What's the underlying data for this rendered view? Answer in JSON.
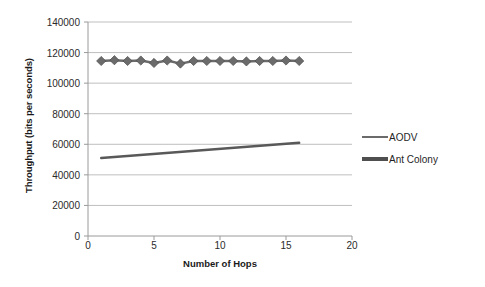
{
  "chart_data": {
    "type": "line",
    "title": "",
    "xlabel": "Number of Hops",
    "ylabel": "Throughput (bits per seconds)",
    "xlim": [
      0,
      20
    ],
    "ylim": [
      0,
      140000
    ],
    "xticks": [
      0,
      5,
      10,
      15,
      20
    ],
    "yticks": [
      0,
      20000,
      40000,
      60000,
      80000,
      100000,
      120000,
      140000
    ],
    "ytick_labels": [
      "0",
      "20000",
      "40000",
      "60000",
      "80000",
      "100000",
      "120000",
      "140000"
    ],
    "xtick_labels": [
      "0",
      "5",
      "10",
      "15",
      "20"
    ],
    "grid": "horizontal",
    "legend_position": "right",
    "series": [
      {
        "name": "AODV",
        "color": "#6b6b6b",
        "marker": "diamond",
        "x": [
          1,
          2,
          3,
          4,
          5,
          6,
          7,
          8,
          9,
          10,
          11,
          12,
          13,
          14,
          15,
          16
        ],
        "values": [
          114500,
          115000,
          114500,
          114800,
          113200,
          114800,
          112800,
          114500,
          114500,
          114500,
          114500,
          114200,
          114500,
          114500,
          114800,
          114500
        ]
      },
      {
        "name": "Ant Colony",
        "color": "#595959",
        "marker": "none",
        "x": [
          1,
          16
        ],
        "values": [
          51000,
          61000
        ]
      }
    ]
  },
  "legend": {
    "entries": [
      {
        "label": "AODV",
        "color": "#6b6b6b"
      },
      {
        "label": "Ant Colony",
        "color": "#4f4f4f"
      }
    ]
  },
  "axes": {
    "x_title": "Number of Hops",
    "y_title": "Throughput (bits per seconds)"
  }
}
